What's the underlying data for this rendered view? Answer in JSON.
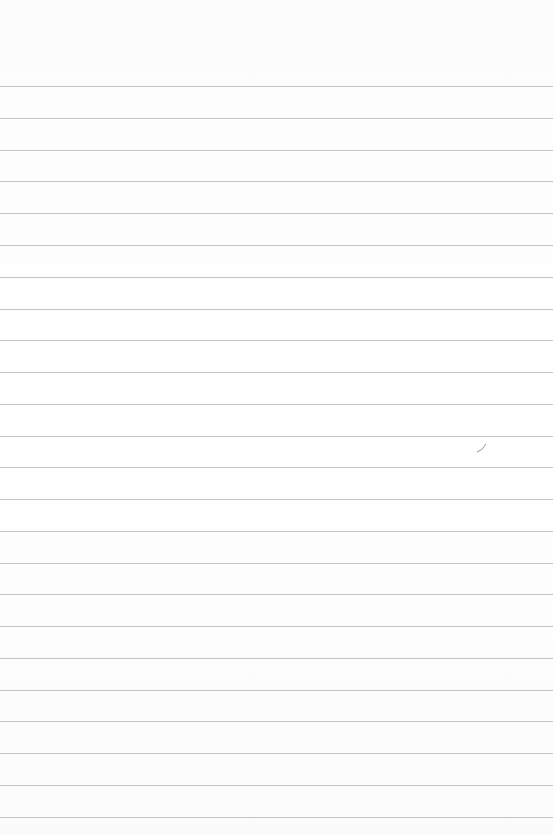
{
  "paper": {
    "kind": "lined-paper",
    "line_color": "#c4c4c4",
    "background_color": "#fdfdfd",
    "rule_positions_y": [
      86,
      118,
      150,
      181,
      213,
      245,
      277,
      309,
      340,
      372,
      404,
      436,
      467,
      499,
      531,
      563,
      594,
      626,
      658,
      690,
      721,
      753,
      785,
      817
    ]
  },
  "mark": {
    "x": 476,
    "y": 442,
    "color": "#8a8a8a"
  }
}
